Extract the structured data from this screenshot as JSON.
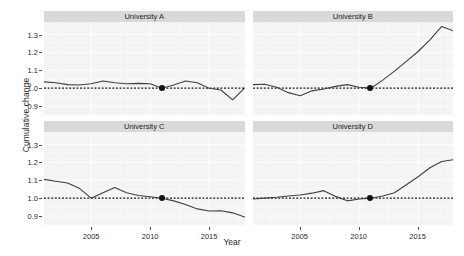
{
  "chart_data": {
    "type": "line",
    "title": "",
    "xlabel": "Year",
    "ylabel": "Cumulative change",
    "xlim": [
      2001,
      2018
    ],
    "ylim": [
      0.85,
      1.37
    ],
    "grid": true,
    "legend": "none",
    "facet_layout": "2x2",
    "x_ticks": [
      2005,
      2010,
      2015
    ],
    "x_tick_labels": [
      "2005",
      "2010",
      "2015"
    ],
    "y_ticks": [
      0.9,
      1.0,
      1.1,
      1.2,
      1.3
    ],
    "y_tick_labels": [
      "0.9",
      "1.0",
      "1.1",
      "1.2",
      "1.3"
    ],
    "reference_line": {
      "y": 1.0,
      "style": "dashed",
      "color": "#1a1a1a"
    },
    "marker": {
      "year": 2011,
      "value": 1.0,
      "shape": "filled-circle",
      "color": "#111111"
    },
    "line_color": "#3f3f3f",
    "panel_background": "#f4f4f4",
    "strip_background": "#d9d9d9",
    "x": [
      2001,
      2002,
      2003,
      2004,
      2005,
      2006,
      2007,
      2008,
      2009,
      2010,
      2011,
      2012,
      2013,
      2014,
      2015,
      2016,
      2017,
      2018
    ],
    "panels": [
      {
        "label": "University A",
        "values": [
          1.035,
          1.03,
          1.02,
          1.018,
          1.025,
          1.04,
          1.03,
          1.025,
          1.027,
          1.025,
          1.0,
          1.018,
          1.04,
          1.03,
          1.0,
          0.99,
          0.935,
          1.0
        ]
      },
      {
        "label": "University B",
        "values": [
          1.02,
          1.022,
          1.005,
          0.975,
          0.958,
          0.985,
          0.995,
          1.01,
          1.02,
          1.005,
          1.0,
          1.045,
          1.095,
          1.15,
          1.205,
          1.27,
          1.345,
          1.32
        ]
      },
      {
        "label": "University C",
        "values": [
          1.105,
          1.095,
          1.085,
          1.055,
          1.0,
          1.03,
          1.06,
          1.03,
          1.015,
          1.008,
          1.0,
          0.985,
          0.965,
          0.94,
          0.928,
          0.93,
          0.918,
          0.895
        ]
      },
      {
        "label": "University D",
        "values": [
          0.995,
          1.0,
          1.005,
          1.012,
          1.018,
          1.028,
          1.042,
          1.01,
          0.985,
          0.995,
          1.0,
          1.012,
          1.03,
          1.075,
          1.12,
          1.17,
          1.205,
          1.215
        ]
      }
    ]
  }
}
